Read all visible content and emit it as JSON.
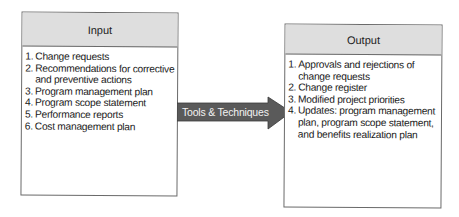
{
  "input": {
    "title": "Input",
    "items": [
      {
        "num": "1.",
        "text": "Change requests"
      },
      {
        "num": "2.",
        "text": "Recommendations for corrective and preventive actions"
      },
      {
        "num": "3.",
        "text": "Program management plan"
      },
      {
        "num": "4.",
        "text": "Program scope statement"
      },
      {
        "num": "5.",
        "text": "Performance reports"
      },
      {
        "num": "6.",
        "text": "Cost management plan"
      }
    ]
  },
  "arrow": {
    "label": "Tools & Techniques",
    "color": "#5a5a5a"
  },
  "output": {
    "title": "Output",
    "items": [
      {
        "num": "1.",
        "text": "Approvals and rejections of change requests"
      },
      {
        "num": "2.",
        "text": "Change register"
      },
      {
        "num": "3.",
        "text": "Modified project priorities"
      },
      {
        "num": "4.",
        "text": "Updates: program management plan, program scope statement, and benefits realization plan"
      }
    ]
  }
}
